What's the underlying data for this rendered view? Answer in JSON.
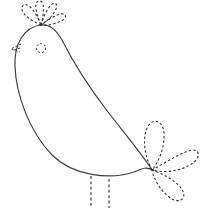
{
  "document": {
    "kind": "line-art-tracing-worksheet",
    "subject": "bird",
    "title": "Bird Tracing Worksheet",
    "background_color": "#ffffff",
    "solid_line_color": "#3b3b41",
    "dashed_line_color": "#2e2e33",
    "canvas": {
      "width": 202,
      "height": 209
    },
    "text_labels": [],
    "notes": "No visible text in the artwork."
  },
  "artwork": {
    "body": {
      "name": "bird-body",
      "style": "solid",
      "description": "Large teardrop/leaf shaped closed outline forming head at upper-left and belly sweeping to lower-right point",
      "path": "M 41 25 C 24 27 14 44 15 66 C 16 96 30 132 52 155 C 73 176 110 180 134 172 C 141 169 147 166 152 170 C 148 162 130 140 108 112 C 88 86 71 58 62 40 C 56 30 50 24 41 25 Z"
    },
    "crest": {
      "name": "bird-crest",
      "style": "dashed",
      "petal_count": 4,
      "origin": {
        "x": 41,
        "y": 25
      },
      "petals": [
        {
          "id": "crest-petal-1",
          "path": "M 41 25 C 32 21 24 16 22 10 C 21 5 25 3 29 6 C 34 10 39 19 41 25 Z"
        },
        {
          "id": "crest-petal-2",
          "path": "M 41 25 C 38 18 35 9 36 4 C 37 0 42 0 43 4 C 44 11 43 19 41 25 Z"
        },
        {
          "id": "crest-petal-3",
          "path": "M 41 25 C 43 18 47 9 51 5 C 55 1 58 4 56 9 C 53 16 46 22 41 25 Z"
        },
        {
          "id": "crest-petal-4",
          "path": "M 41 25 C 46 21 55 15 61 14 C 66 13 67 17 63 20 C 56 24 47 26 41 25 Z"
        }
      ]
    },
    "beak": {
      "name": "bird-beak",
      "style": "dashed",
      "description": "Small arrow/chevron pointing left from head edge near eye level",
      "paths": [
        "M 21 44 L 11 49 L 20 52",
        "M 20 48 L 14 50"
      ]
    },
    "eye": {
      "name": "bird-eye",
      "style": "dashed",
      "shape": "circle",
      "center": {
        "x": 41,
        "y": 48
      },
      "radius": 4.6
    },
    "tail": {
      "name": "bird-tail",
      "style": "dashed",
      "petal_count": 3,
      "origin": {
        "x": 152,
        "y": 170
      },
      "petals": [
        {
          "id": "tail-petal-upper",
          "path": "M 152 170 C 145 157 142 140 147 128 C 152 117 163 120 164 133 C 165 148 158 163 152 170 Z"
        },
        {
          "id": "tail-petal-right",
          "path": "M 152 170 C 163 164 177 155 188 151 C 199 147 202 156 193 163 C 180 172 163 173 152 170 Z"
        },
        {
          "id": "tail-petal-lower",
          "path": "M 152 170 C 161 173 175 180 181 188 C 188 197 181 204 172 199 C 161 192 154 180 152 170 Z"
        }
      ]
    },
    "legs": {
      "name": "bird-legs",
      "style": "dashed",
      "count": 2,
      "items": [
        {
          "id": "leg-left",
          "path": "M 91 176 L 91 208"
        },
        {
          "id": "leg-right",
          "path": "M 109 179 L 109 208"
        }
      ]
    }
  }
}
